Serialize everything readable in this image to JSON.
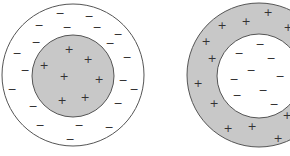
{
  "figure": {
    "colors": {
      "background": "#ffffff",
      "shaded": "#c8c8c8",
      "outline": "#555555",
      "sign": "#333333"
    },
    "diagrams": [
      {
        "name": "solid-charged-sphere-with-shell",
        "outer_circle": {
          "cx": 73,
          "cy": 75,
          "r": 71,
          "fill": "#ffffff"
        },
        "inner_circle": {
          "cx": 73,
          "cy": 76,
          "r": 41,
          "fill": "#c8c8c8"
        },
        "plus_label": "+",
        "minus_label": "−",
        "plus_signs": [
          [
            69,
            49
          ],
          [
            88,
            59
          ],
          [
            44,
            65
          ],
          [
            64,
            76
          ],
          [
            99,
            79
          ],
          [
            62,
            100
          ],
          [
            85,
            97
          ]
        ],
        "minus_signs": [
          [
            60,
            13
          ],
          [
            89,
            16
          ],
          [
            39,
            25
          ],
          [
            67,
            27
          ],
          [
            97,
            27
          ],
          [
            118,
            34
          ],
          [
            36,
            42
          ],
          [
            110,
            43
          ],
          [
            17,
            53
          ],
          [
            127,
            57
          ],
          [
            25,
            70
          ],
          [
            123,
            80
          ],
          [
            12,
            89
          ],
          [
            134,
            89
          ],
          [
            33,
            106
          ],
          [
            118,
            103
          ],
          [
            40,
            125
          ],
          [
            79,
            125
          ],
          [
            109,
            127
          ],
          [
            70,
            139
          ]
        ]
      },
      {
        "name": "hollow-charged-shell",
        "outer_circle": {
          "cx": 259,
          "cy": 75,
          "r": 72,
          "fill": "#c8c8c8"
        },
        "inner_circle": {
          "cx": 259,
          "cy": 76,
          "r": 42,
          "fill": "#ffffff"
        },
        "plus_label": "+",
        "minus_label": "−",
        "plus_signs": [
          [
            268,
            12
          ],
          [
            246,
            21
          ],
          [
            222,
            25
          ],
          [
            288,
            27
          ],
          [
            206,
            41
          ],
          [
            212,
            58
          ],
          [
            198,
            83
          ],
          [
            214,
            103
          ],
          [
            287,
            115
          ],
          [
            252,
            126
          ],
          [
            228,
            128
          ],
          [
            278,
            138
          ]
        ],
        "minus_signs": [
          [
            260,
            44
          ],
          [
            239,
            53
          ],
          [
            271,
            58
          ],
          [
            251,
            70
          ],
          [
            234,
            79
          ],
          [
            280,
            76
          ],
          [
            263,
            90
          ],
          [
            237,
            95
          ],
          [
            274,
            104
          ]
        ]
      }
    ]
  }
}
